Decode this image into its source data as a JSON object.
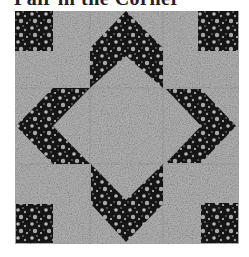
{
  "title": "Pair in the Corner",
  "block": {
    "name": "quilt-block",
    "colors": {
      "background": "#ffffff",
      "light_fabric": "#9a9a9a",
      "light_fabric_speckle": "#c8c8c8",
      "dark_fabric": "#151515",
      "dark_fabric_flower": "#b8b8b8"
    },
    "pieces": [
      {
        "name": "corner-square-top-left",
        "fabric": "dark"
      },
      {
        "name": "corner-square-top-right",
        "fabric": "dark"
      },
      {
        "name": "corner-square-bottom-left",
        "fabric": "dark"
      },
      {
        "name": "corner-square-bottom-right",
        "fabric": "dark"
      },
      {
        "name": "chevron-top",
        "fabric": "dark"
      },
      {
        "name": "chevron-right",
        "fabric": "dark"
      },
      {
        "name": "chevron-bottom",
        "fabric": "dark"
      },
      {
        "name": "chevron-left",
        "fabric": "dark"
      },
      {
        "name": "center-diamond",
        "fabric": "light"
      }
    ]
  }
}
